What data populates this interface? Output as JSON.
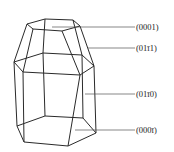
{
  "diagram": {
    "title": "",
    "labels": [
      {
        "id": "basal-top",
        "text": "(0001)",
        "y": 28
      },
      {
        "id": "pyramidal",
        "text": "(01ī1)",
        "y": 49
      },
      {
        "id": "prism",
        "text": "(01ī0)",
        "y": 95
      },
      {
        "id": "basal-bottom",
        "text": "(000ī)",
        "y": 131
      }
    ]
  }
}
